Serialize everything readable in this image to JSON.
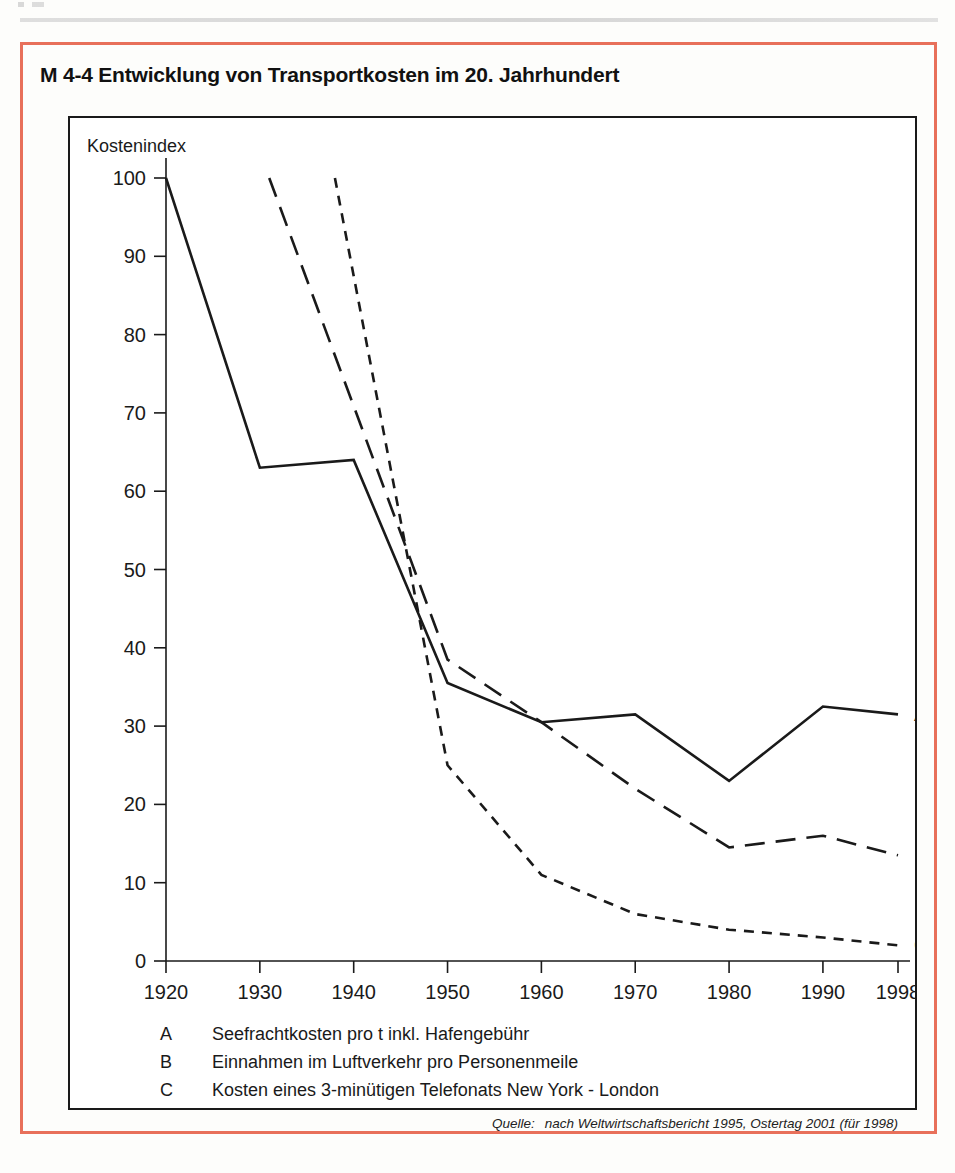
{
  "figure": {
    "title": "M 4-4 Entwicklung von Transportkosten im 20. Jahrhundert",
    "border_color": "#e8705a",
    "line_color": "#1a1a1a"
  },
  "source": {
    "label": "Quelle:",
    "text": "nach Weltwirtschaftsbericht 1995,  Ostertag 2001 (für 1998)"
  },
  "legend": [
    {
      "key": "A",
      "text": "Seefrachtkosten pro t inkl. Hafengebühr"
    },
    {
      "key": "B",
      "text": "Einnahmen im Luftverkehr pro Personenmeile"
    },
    {
      "key": "C",
      "text": "Kosten eines 3-minütigen Telefonats New York - London"
    }
  ],
  "chart_data": {
    "type": "line",
    "title": "M 4-4 Entwicklung von Transportkosten im 20. Jahrhundert",
    "xlabel": "",
    "ylabel": "Kostenindex",
    "ylim": [
      0,
      100
    ],
    "xlim": [
      1920,
      1998
    ],
    "grid": false,
    "legend_position": "below-plot",
    "yticks": [
      0,
      10,
      20,
      30,
      40,
      50,
      60,
      70,
      80,
      90,
      100
    ],
    "xticks": [
      1920,
      1930,
      1940,
      1950,
      1960,
      1970,
      1980,
      1990,
      1998
    ],
    "xticklabels": [
      "1920",
      "1930",
      "1940",
      "1950",
      "1960",
      "1970",
      "1980",
      "1990",
      "1998"
    ],
    "series": [
      {
        "name": "A",
        "label": "Seefrachtkosten pro t inkl. Hafengebühr",
        "style": "solid",
        "end_label": "A",
        "x": [
          1920,
          1930,
          1940,
          1950,
          1960,
          1970,
          1980,
          1990,
          1998
        ],
        "values": [
          100,
          63,
          64,
          35.5,
          30.5,
          31.5,
          23,
          32.5,
          31.5
        ]
      },
      {
        "name": "B",
        "label": "Einnahmen im Luftverkehr pro Personenmeile",
        "style": "long-dash",
        "end_label": "B",
        "x": [
          1931,
          1950,
          1960,
          1970,
          1980,
          1990,
          1998
        ],
        "values": [
          100,
          38.5,
          30.5,
          22,
          14.5,
          16,
          13.5
        ]
      },
      {
        "name": "C",
        "label": "Kosten eines 3-minütigen Telefonats New York - London",
        "style": "short-dash",
        "end_label": "C",
        "x": [
          1938,
          1950,
          1960,
          1970,
          1980,
          1990,
          1998
        ],
        "values": [
          100,
          25,
          11,
          6,
          4,
          3,
          2
        ]
      }
    ]
  }
}
